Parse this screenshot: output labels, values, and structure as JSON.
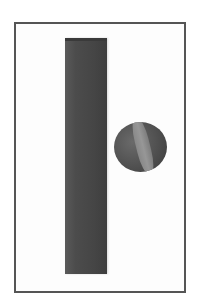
{
  "scene": {
    "description": "Grayscale rendering of a tall rectangular bar and a sphere inside a bordered frame",
    "colors": {
      "background": "#ffffff",
      "frame_border": "#555555",
      "bar": "#4a4a4a",
      "sphere": "#555555",
      "sphere_band": "#939393"
    },
    "objects": [
      {
        "name": "vertical-bar",
        "shape": "rectangular prism"
      },
      {
        "name": "sphere",
        "shape": "sphere with light band"
      }
    ]
  }
}
